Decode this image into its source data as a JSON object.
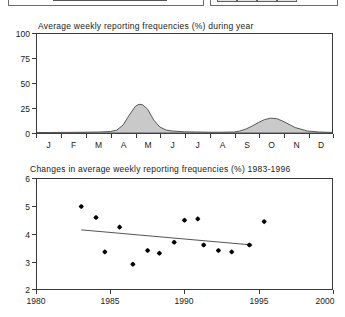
{
  "top_panels": {
    "left_panel_name": "cropped-panel-left",
    "right_panel_name": "cropped-panel-right"
  },
  "chart_data": [
    {
      "id": "seasonal",
      "type": "area",
      "title": "Average weekly reporting frequencies (%) during year",
      "xlabel": "",
      "ylabel": "",
      "ylim": [
        0,
        100
      ],
      "yticks": [
        "0",
        "25",
        "50",
        "75",
        "100"
      ],
      "ytick_values": [
        0,
        25,
        50,
        75,
        100
      ],
      "categories": [
        "J",
        "F",
        "M",
        "A",
        "M",
        "J",
        "J",
        "A",
        "S",
        "O",
        "N",
        "D"
      ],
      "grid": false,
      "legend": "none",
      "fill_color": "#c9c9c9",
      "line_color": "#4a4a4a",
      "x": [
        0.0,
        0.5,
        1.0,
        1.5,
        2.0,
        2.5,
        3.0,
        3.25,
        3.5,
        3.75,
        4.0,
        4.15,
        4.3,
        4.5,
        4.75,
        5.0,
        5.25,
        5.5,
        6.0,
        6.5,
        7.0,
        7.5,
        8.0,
        8.25,
        8.5,
        8.75,
        9.0,
        9.25,
        9.5,
        9.75,
        10.0,
        10.5,
        11.0,
        11.5,
        12.0
      ],
      "values": [
        0.5,
        0.5,
        0.6,
        0.7,
        0.8,
        1.0,
        1.5,
        3.0,
        8.0,
        18.0,
        27.0,
        29.0,
        28.5,
        24.0,
        13.0,
        6.0,
        3.0,
        2.0,
        1.2,
        1.0,
        0.8,
        0.8,
        1.0,
        2.0,
        4.0,
        7.0,
        10.5,
        13.5,
        15.0,
        14.5,
        12.0,
        5.5,
        2.0,
        1.0,
        0.6
      ]
    },
    {
      "id": "trend",
      "type": "scatter",
      "title": "Changes in average weekly reporting frequencies (%) 1983-1996",
      "xlabel": "",
      "ylabel": "",
      "xlim": [
        1980,
        2000
      ],
      "ylim": [
        2,
        6
      ],
      "xticks": [
        "1980",
        "1985",
        "1990",
        "1995",
        "2000"
      ],
      "xtick_values": [
        1980,
        1985,
        1990,
        1995,
        2000
      ],
      "yticks": [
        "2",
        "3",
        "4",
        "5",
        "6"
      ],
      "ytick_values": [
        2,
        3,
        4,
        5,
        6
      ],
      "grid": false,
      "legend": "none",
      "marker": "diamond",
      "marker_color": "#000000",
      "trendline_color": "#555555",
      "points": [
        {
          "x": 1983.0,
          "y": 5.0
        },
        {
          "x": 1984.0,
          "y": 4.6
        },
        {
          "x": 1984.6,
          "y": 3.35
        },
        {
          "x": 1985.6,
          "y": 4.25
        },
        {
          "x": 1986.5,
          "y": 2.9
        },
        {
          "x": 1987.5,
          "y": 3.4
        },
        {
          "x": 1988.3,
          "y": 3.3
        },
        {
          "x": 1989.3,
          "y": 3.7
        },
        {
          "x": 1990.0,
          "y": 4.5
        },
        {
          "x": 1990.9,
          "y": 4.55
        },
        {
          "x": 1991.3,
          "y": 3.6
        },
        {
          "x": 1992.3,
          "y": 3.4
        },
        {
          "x": 1993.2,
          "y": 3.35
        },
        {
          "x": 1994.4,
          "y": 3.6
        },
        {
          "x": 1995.4,
          "y": 4.45
        }
      ],
      "trendline": {
        "x1": 1983.0,
        "y1": 4.15,
        "x2": 1994.6,
        "y2": 3.6
      }
    }
  ]
}
